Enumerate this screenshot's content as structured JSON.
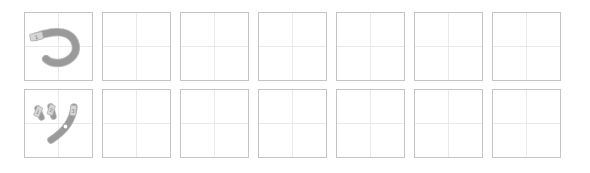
{
  "worksheet": {
    "title": "Kana Handwriting Practice Grid",
    "columns_per_row": 7,
    "rows": [
      {
        "row_label": "hiragana-tsu-row",
        "character": "つ",
        "romaji": "tsu",
        "script": "hiragana",
        "stroke_count": 1,
        "stroke_numbers": [
          "1"
        ],
        "cells": [
          {
            "cell_name": "model-cell",
            "type": "model",
            "character": "つ",
            "filled": true
          },
          {
            "cell_name": "practice-cell",
            "type": "practice",
            "character": "",
            "filled": false
          },
          {
            "cell_name": "practice-cell",
            "type": "practice",
            "character": "",
            "filled": false
          },
          {
            "cell_name": "practice-cell",
            "type": "practice",
            "character": "",
            "filled": false
          },
          {
            "cell_name": "practice-cell",
            "type": "practice",
            "character": "",
            "filled": false
          },
          {
            "cell_name": "practice-cell",
            "type": "practice",
            "character": "",
            "filled": false
          },
          {
            "cell_name": "practice-cell",
            "type": "practice",
            "character": "",
            "filled": false
          }
        ]
      },
      {
        "row_label": "katakana-tsu-row",
        "character": "ツ",
        "romaji": "tsu",
        "script": "katakana",
        "stroke_count": 3,
        "stroke_numbers": [
          "1",
          "2",
          "3"
        ],
        "cells": [
          {
            "cell_name": "model-cell",
            "type": "model",
            "character": "ツ",
            "filled": true
          },
          {
            "cell_name": "practice-cell",
            "type": "practice",
            "character": "",
            "filled": false
          },
          {
            "cell_name": "practice-cell",
            "type": "practice",
            "character": "",
            "filled": false
          },
          {
            "cell_name": "practice-cell",
            "type": "practice",
            "character": "",
            "filled": false
          },
          {
            "cell_name": "practice-cell",
            "type": "practice",
            "character": "",
            "filled": false
          },
          {
            "cell_name": "practice-cell",
            "type": "practice",
            "character": "",
            "filled": false
          },
          {
            "cell_name": "practice-cell",
            "type": "practice",
            "character": "",
            "filled": false
          }
        ]
      }
    ],
    "colors": {
      "background": "#ffffff",
      "cell_border": "#c4c4c4",
      "guide_line": "#e9e9e9",
      "stroke": "#9a9a9a",
      "stroke_outline": "#bdbdbd",
      "marker_fill": "#d6d6d6",
      "marker_text": "#6f6f6f"
    }
  }
}
